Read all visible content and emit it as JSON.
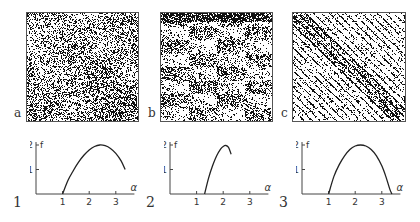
{
  "panels": [
    {
      "label": "a",
      "pattern": "uniform-random",
      "seed": 11,
      "density": 0.42
    },
    {
      "label": "b",
      "pattern": "hierarchical-blocks",
      "seed": 23,
      "density": 0.38
    },
    {
      "label": "c",
      "pattern": "diagonal-stripes",
      "seed": 37,
      "density": 0.33
    }
  ],
  "chart_data": [
    {
      "type": "line",
      "label": "1",
      "xlabel": "α",
      "ylabel": "f",
      "xticks": [
        1,
        2,
        3
      ],
      "yticks": [
        1,
        2
      ],
      "xlim": [
        0,
        3.7
      ],
      "ylim": [
        0,
        2.05
      ],
      "x": [
        1.0,
        1.2,
        1.4,
        1.6,
        1.8,
        2.0,
        2.2,
        2.4,
        2.6,
        2.8,
        3.0,
        3.2,
        3.35
      ],
      "y": [
        0.0,
        0.55,
        0.95,
        1.3,
        1.58,
        1.8,
        1.94,
        2.0,
        1.97,
        1.86,
        1.66,
        1.35,
        1.0
      ]
    },
    {
      "type": "line",
      "label": "2",
      "xlabel": "α",
      "ylabel": "f",
      "xticks": [
        1,
        2,
        3
      ],
      "yticks": [
        1,
        2
      ],
      "xlim": [
        0,
        3.7
      ],
      "ylim": [
        0,
        2.05
      ],
      "x": [
        1.3,
        1.45,
        1.6,
        1.75,
        1.9,
        2.0,
        2.1,
        2.2,
        2.3
      ],
      "y": [
        0.0,
        0.65,
        1.15,
        1.55,
        1.83,
        1.94,
        1.98,
        1.9,
        1.62
      ]
    },
    {
      "type": "line",
      "label": "3",
      "xlabel": "α",
      "ylabel": "f",
      "xticks": [
        1,
        2,
        3
      ],
      "yticks": [
        1,
        2
      ],
      "xlim": [
        0,
        3.7
      ],
      "ylim": [
        0,
        2.05
      ],
      "x": [
        1.0,
        1.2,
        1.4,
        1.6,
        1.8,
        2.0,
        2.2,
        2.4,
        2.6,
        2.8,
        3.0,
        3.15,
        3.3,
        3.38
      ],
      "y": [
        0.0,
        0.72,
        1.2,
        1.56,
        1.82,
        1.96,
        2.0,
        1.96,
        1.82,
        1.56,
        1.15,
        0.72,
        0.2,
        0.0
      ]
    }
  ]
}
